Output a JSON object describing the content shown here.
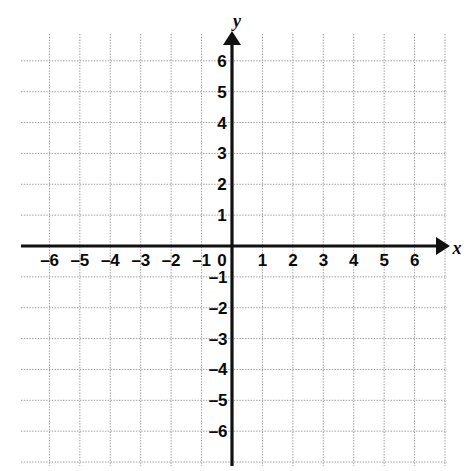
{
  "chart_data": {
    "type": "scatter",
    "title": "",
    "subtitle": "",
    "xlabel": "x",
    "ylabel": "y",
    "xlim": [
      -7,
      7
    ],
    "ylim": [
      -7,
      7
    ],
    "grid": true,
    "legend": null,
    "series": [],
    "x_tick_labels": [
      "–6",
      "–5",
      "–4",
      "–3",
      "–2",
      "–1",
      "0",
      "1",
      "2",
      "3",
      "4",
      "5",
      "6"
    ],
    "x_tick_values": [
      -6,
      -5,
      -4,
      -3,
      -2,
      -1,
      0,
      1,
      2,
      3,
      4,
      5,
      6
    ],
    "y_tick_labels": [
      "6",
      "5",
      "4",
      "3",
      "2",
      "1",
      "–1",
      "–2",
      "–3",
      "–4",
      "–5",
      "–6"
    ],
    "y_tick_values": [
      6,
      5,
      4,
      3,
      2,
      1,
      -1,
      -2,
      -3,
      -4,
      -5,
      -6
    ],
    "origin_label": "0",
    "grid_step": 1,
    "annotations": [],
    "data_points": []
  },
  "style": {
    "background_color": "#ffffff",
    "grid_color": "#9a9a9a",
    "axis_color": "#111111",
    "label_color": "#0a0a0a"
  },
  "geometry": {
    "grid_left": 21,
    "grid_right": 447,
    "grid_top": 34,
    "grid_bottom": 466,
    "origin_x": 232,
    "origin_y": 246,
    "step_x": 30.43,
    "step_y": 30.86
  }
}
